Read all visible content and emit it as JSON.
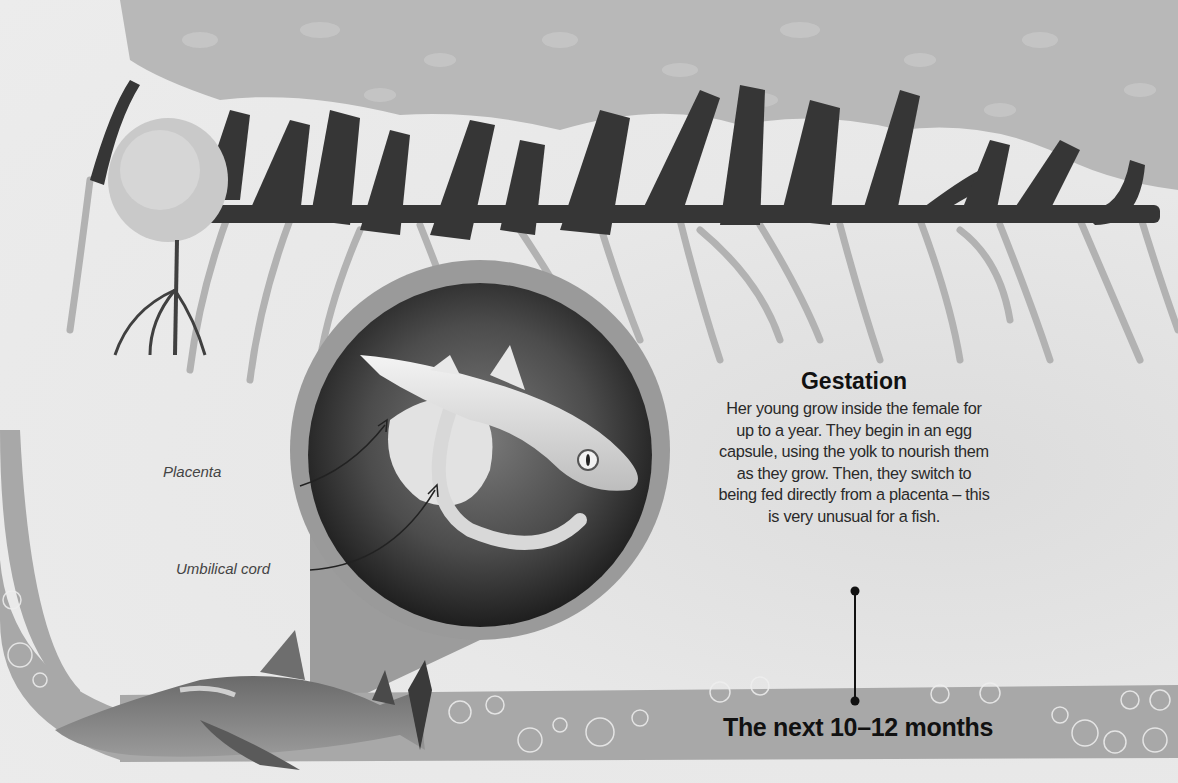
{
  "section": {
    "heading": "Gestation",
    "body": "Her young grow inside the female for up to a year. They begin in an egg capsule, using the yolk to nourish them as they grow. Then, they switch to being fed directly from a placenta – this is very unusual for a fish.",
    "timeline_label": "The next 10–12 months"
  },
  "callouts": {
    "placenta": "Placenta",
    "umbilical_cord": "Umbilical cord"
  },
  "illustration": {
    "top": "mangrove-canopy-and-roots",
    "inset": "shark-embryo-in-womb",
    "bottom": "adult-lemon-shark",
    "band": "water-band-with-bubbles"
  },
  "colors": {
    "background": "#e8e8e8",
    "band": "#a8a8a8",
    "ring": "#9a9a9a",
    "trunk": "#3a3a3a",
    "canopy": "#b4b4b4",
    "roots": "#b0b0b0",
    "text": "#111111"
  }
}
